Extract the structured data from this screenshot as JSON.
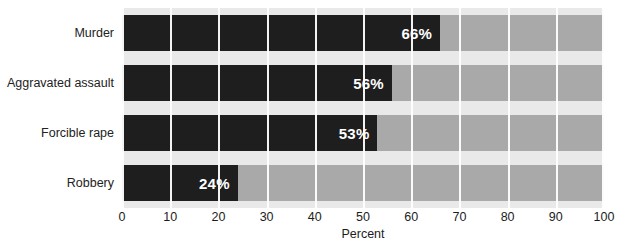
{
  "chart_data": {
    "type": "bar",
    "orientation": "horizontal",
    "title": "",
    "xlabel": "Percent",
    "ylabel": "",
    "categories": [
      "Murder",
      "Aggravated assault",
      "Forcible rape",
      "Robbery"
    ],
    "values": [
      66,
      56,
      53,
      24
    ],
    "data_labels": [
      "66%",
      "56%",
      "53%",
      "24%"
    ],
    "xlim": [
      0,
      100
    ],
    "xticks": [
      0,
      10,
      20,
      30,
      40,
      50,
      60,
      70,
      80,
      90,
      100
    ],
    "xtick_labels": [
      "0",
      "10",
      "20",
      "30",
      "40",
      "50",
      "60",
      "70",
      "80",
      "90",
      "100"
    ],
    "grid": "vertical-white-gridlines",
    "legend": "none",
    "colors": {
      "bar": "#1e1e1e",
      "track": "#a9a9a9",
      "plot_background": "#e9e9e9",
      "gridline": "#ffffff",
      "data_label": "#ffffff",
      "text": "#1c1c1c",
      "page_background": "#ffffff"
    }
  }
}
